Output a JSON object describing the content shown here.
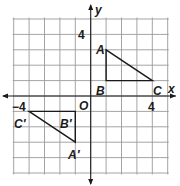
{
  "figure": {
    "type": "coordinate-plane",
    "origin_px": [
      90.7,
      96
    ],
    "unit_px": 15.4,
    "grid_range": {
      "x": [
        -5,
        5
      ],
      "y": [
        -5,
        5
      ]
    },
    "colors": {
      "grid": "#9a9a9a",
      "axis": "#1a1a1a",
      "shape": "#1a1a1a"
    },
    "axis_labels": {
      "x": "x",
      "y": "y",
      "origin": "O"
    },
    "tick_labels": [
      {
        "text": "4",
        "axis": "y",
        "value": 4
      },
      {
        "text": "4",
        "axis": "x",
        "value": 4
      },
      {
        "text": "−4",
        "axis": "x",
        "value": -4
      }
    ],
    "triangles": [
      {
        "name": "ABC",
        "vertices": [
          {
            "label": "A",
            "x": 1,
            "y": 3
          },
          {
            "label": "B",
            "x": 1,
            "y": 1
          },
          {
            "label": "C",
            "x": 4,
            "y": 1
          }
        ]
      },
      {
        "name": "A'B'C'",
        "vertices": [
          {
            "label": "A′",
            "x": -1,
            "y": -3
          },
          {
            "label": "B′",
            "x": -1,
            "y": -1
          },
          {
            "label": "C′",
            "x": -4,
            "y": -1
          }
        ]
      }
    ]
  }
}
